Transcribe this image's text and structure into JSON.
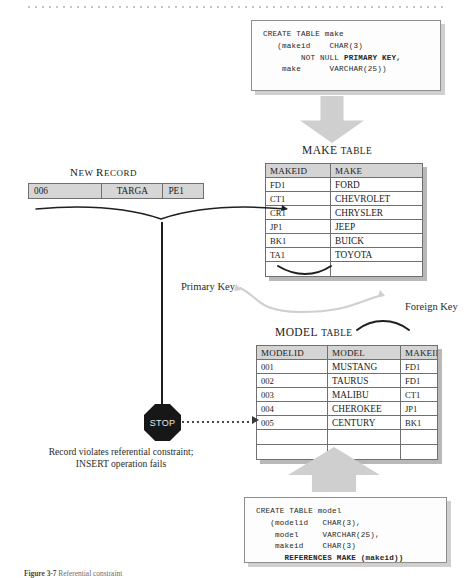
{
  "figure": {
    "caption_label": "Figure 3-7",
    "caption_text": "Referential constraint"
  },
  "sql": {
    "make_ddl_line1": "CREATE TABLE make",
    "make_ddl_line2": "   (makeid    CHAR(3)",
    "make_ddl_line3": "        NOT NULL ",
    "make_ddl_bold": "PRIMARY KEY,",
    "make_ddl_line4": "    make      VARCHAR(25))",
    "model_ddl_line1": "CREATE TABLE model",
    "model_ddl_line2": "   (modelid   CHAR(3),",
    "model_ddl_line3": "    model     VARCHAR(25),",
    "model_ddl_line4": "    makeid    CHAR(3)",
    "model_ddl_bold": "REFERENCES MAKE (makeid))"
  },
  "make_table": {
    "caption_first": "MAKE",
    "caption_rest": "TABLE",
    "columns": [
      "MAKEID",
      "MAKE"
    ],
    "rows": [
      [
        "FD1",
        "FORD"
      ],
      [
        "CT1",
        "CHEVROLET"
      ],
      [
        "CR1",
        "CHRYSLER"
      ],
      [
        "JP1",
        "JEEP"
      ],
      [
        "BK1",
        "BUICK"
      ],
      [
        "TA1",
        "TOYOTA"
      ]
    ],
    "empty_rows": 1
  },
  "model_table": {
    "caption_first": "MODEL",
    "caption_rest": "TABLE",
    "columns": [
      "MODELID",
      "MODEL",
      "MAKEID"
    ],
    "rows": [
      [
        "001",
        "MUSTANG",
        "FD1"
      ],
      [
        "002",
        "TAURUS",
        "FD1"
      ],
      [
        "003",
        "MALIBU",
        "CT1"
      ],
      [
        "004",
        "CHEROKEE",
        "JP1"
      ],
      [
        "005",
        "CENTURY",
        "BK1"
      ]
    ],
    "empty_rows": 2
  },
  "new_record": {
    "caption_first": "N",
    "caption_rest": "EW ",
    "caption_first2": "R",
    "caption_rest2": "ECORD",
    "modelid": "006",
    "model": "TARGA",
    "makeid": "PE1"
  },
  "labels": {
    "primary_key": "Primary Key",
    "foreign_key": "Foreign Key",
    "stop": "STOP",
    "error_line1": "Record violates referential constraint;",
    "error_line2": "INSERT operation fails"
  },
  "colors": {
    "header_fill": "#d4d4d4",
    "arrow_fill": "#cfcfcf",
    "shadow": "#b8b8b8",
    "stop_fill": "#171717",
    "connector": "#c9c9c9"
  }
}
